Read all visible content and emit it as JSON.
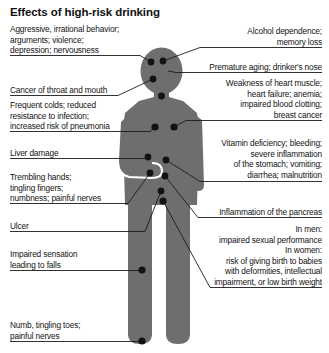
{
  "title": "Effects of high-risk drinking",
  "colors": {
    "background": "#ffffff",
    "figure_body": "#6e6e6e",
    "marker_dot": "#121212",
    "leader_line": "#1b1b1b",
    "text": "#131313",
    "arm_outline": "#ffffff"
  },
  "figure": {
    "name": "human-body-silhouette"
  },
  "callouts_left": [
    {
      "id": "behavior",
      "text": "Aggressive, irrational behavior;\narguments; violence;\ndepression; nervousness"
    },
    {
      "id": "cancer-throat-mouth",
      "text": "Cancer of throat and mouth"
    },
    {
      "id": "frequent-colds",
      "text": "Frequent colds; reduced\nresistance to infection;\nincreased risk of pneumonia"
    },
    {
      "id": "liver-damage",
      "text": "Liver damage"
    },
    {
      "id": "trembling-hands",
      "text": "Trembling hands;\ntingling fingers;\nnumbness; painful nerves"
    },
    {
      "id": "ulcer",
      "text": "Ulcer"
    },
    {
      "id": "impaired-sensation",
      "text": "Impaired sensation\nleading to falls"
    },
    {
      "id": "numb-tingling-toes",
      "text": "Numb, tingling toes;\npainful nerves"
    }
  ],
  "callouts_right": [
    {
      "id": "alcohol-dependence",
      "text": "Alcohol dependence;\nmemory loss"
    },
    {
      "id": "premature-aging",
      "text": "Premature aging; drinker's nose"
    },
    {
      "id": "heart-muscle",
      "text": "Weakness of heart muscle;\nheart failure; anemia;\nimpaired blood clotting;\nbreast cancer"
    },
    {
      "id": "vitamin-deficiency",
      "text": "Vitamin deficiency; bleeding;\nsevere inflammation\nof the stomach; vomiting;\ndiarrhea; malnutrition"
    },
    {
      "id": "pancreas",
      "text": "Inflammation of the pancreas"
    },
    {
      "id": "sexual-reproductive",
      "text": "In men:\nimpaired sexual performance\nIn women:\nrisk of giving birth to babies\nwith deformities, intellectual\nimpairment, or low birth weight"
    }
  ]
}
